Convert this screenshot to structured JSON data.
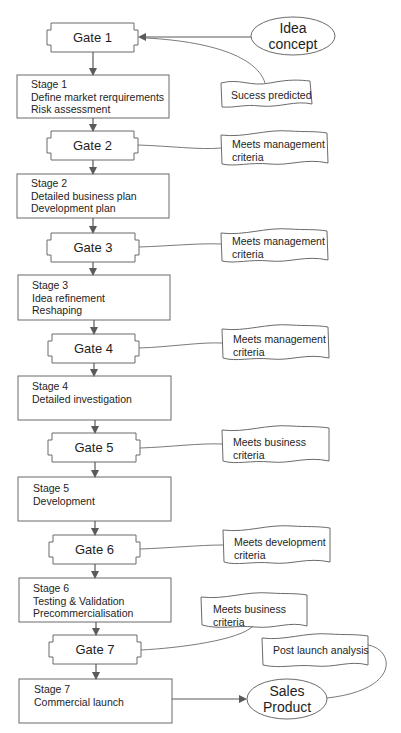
{
  "diagram": {
    "type": "flowchart",
    "gates": [
      {
        "label": "Gate 1"
      },
      {
        "label": "Gate 2"
      },
      {
        "label": "Gate 3"
      },
      {
        "label": "Gate 4"
      },
      {
        "label": "Gate 5"
      },
      {
        "label": "Gate 6"
      },
      {
        "label": "Gate 7"
      }
    ],
    "stages": [
      {
        "title": "Stage 1",
        "lines": [
          "Define market rerquirements",
          "Risk assessment"
        ]
      },
      {
        "title": "Stage 2",
        "lines": [
          "Detailed business plan",
          "Development plan"
        ]
      },
      {
        "title": "Stage 3",
        "lines": [
          "Idea refinement",
          "Reshaping"
        ]
      },
      {
        "title": "Stage 4",
        "lines": [
          "Detailed investigation"
        ]
      },
      {
        "title": "Stage 5",
        "lines": [
          "Development"
        ]
      },
      {
        "title": "Stage 6",
        "lines": [
          "Testing & Validation",
          "Precommercialisation"
        ]
      },
      {
        "title": "Stage 7",
        "lines": [
          "Commercial launch"
        ]
      }
    ],
    "notes": [
      {
        "attached_to": "Gate 1",
        "lines": [
          "Sucess predicted"
        ]
      },
      {
        "attached_to": "Gate 2",
        "lines": [
          "Meets management",
          "criteria"
        ]
      },
      {
        "attached_to": "Gate 3",
        "lines": [
          "Meets management",
          "criteria"
        ]
      },
      {
        "attached_to": "Gate 4",
        "lines": [
          "Meets management",
          "criteria"
        ]
      },
      {
        "attached_to": "Gate 5",
        "lines": [
          "Meets business",
          "criteria"
        ]
      },
      {
        "attached_to": "Gate 6",
        "lines": [
          "Meets development",
          "criteria"
        ]
      },
      {
        "attached_to": "Gate 7",
        "lines": [
          "Meets business",
          "criteria"
        ]
      },
      {
        "attached_to": "Sales Product",
        "lines": [
          "Post launch analysis"
        ]
      }
    ],
    "terminals": [
      {
        "id": "start",
        "lines": [
          "Idea",
          "concept"
        ]
      },
      {
        "id": "end",
        "lines": [
          "Sales",
          "Product"
        ]
      }
    ],
    "colors": {
      "stroke": "#6b6b6b",
      "arrow": "#5a5a5a",
      "fill": "#ffffff",
      "text": "#1e1e1e"
    }
  }
}
